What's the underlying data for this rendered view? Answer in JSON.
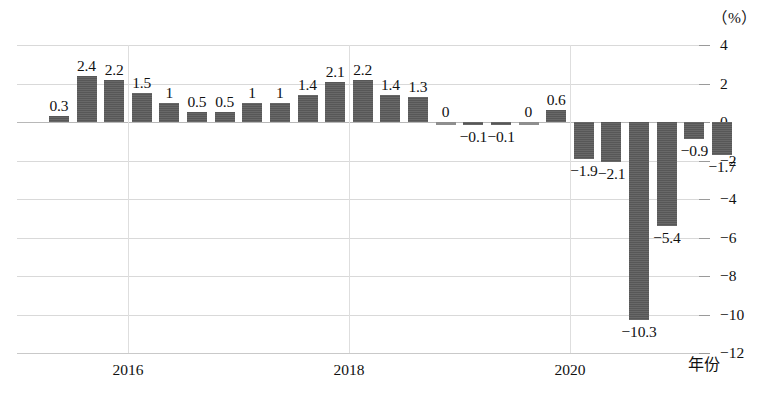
{
  "chart_data": {
    "type": "bar",
    "title": "",
    "xlabel": "年份",
    "ylabel": "",
    "unit_label": "（%）",
    "ylim": [
      -12,
      4
    ],
    "ytick_labels": [
      "4",
      "2",
      "0",
      "-2",
      "-4",
      "-6",
      "-8",
      "-10",
      "-12"
    ],
    "ytick_values": [
      4,
      2,
      0,
      -2,
      -4,
      -6,
      -8,
      -10,
      -12
    ],
    "xtick_labels": [
      "2016",
      "2018",
      "2020"
    ],
    "xtick_values": [
      2016,
      2018,
      2020
    ],
    "grid": true,
    "legend": "none",
    "bar_color": "#575757",
    "categories": [
      "2015Q2",
      "2015Q3",
      "2015Q4",
      "2016Q1",
      "2016Q2",
      "2016Q3",
      "2016Q4",
      "2017Q1",
      "2017Q2",
      "2017Q3",
      "2017Q4",
      "2018Q1",
      "2018Q2",
      "2018Q3",
      "2018Q4",
      "2019Q1",
      "2019Q2",
      "2019Q3",
      "2019Q4",
      "2020Q1",
      "2020Q2",
      "2020Q3",
      "2020Q4",
      "2021Q1",
      "2021Q2"
    ],
    "values": [
      0.3,
      2.4,
      2.2,
      1.5,
      1,
      0.5,
      0.5,
      1,
      1,
      1.4,
      2.1,
      2.2,
      1.4,
      1.3,
      0,
      -0.1,
      -0.1,
      0,
      0.6,
      -1.9,
      -2.1,
      -10.3,
      -5.4,
      -0.9,
      -1.7
    ],
    "data_labels": [
      "0.3",
      "2.4",
      "2.2",
      "1.5",
      "1",
      "0.5",
      "0.5",
      "1",
      "1",
      "1.4",
      "2.1",
      "2.2",
      "1.4",
      "1.3",
      "0",
      "−0.1",
      "−0.1",
      "0",
      "0.6",
      "−1.9",
      "−2.1",
      "−10.3",
      "−5.4",
      "−0.9",
      "−1.7"
    ]
  }
}
